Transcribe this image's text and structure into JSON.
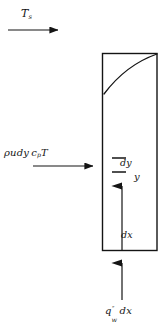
{
  "figure": {
    "type": "engineering-diagram",
    "width": 163,
    "height": 332,
    "background_color": "#ffffff",
    "line_color": "#141414"
  },
  "labels": {
    "freestream_temperature": {
      "base": "T",
      "subscript": "s",
      "full": "Ts",
      "x": 21,
      "y": 8
    },
    "enthalpy_influx": {
      "full": "ρudy c_p T",
      "rho": "ρ",
      "u": "u",
      "dy": "dy",
      "c": "c",
      "c_subscript": "p",
      "T": "T",
      "x": 4,
      "y": 148
    },
    "dy": {
      "full": "dy",
      "x": 120,
      "y": 158
    },
    "y_axis": {
      "full": "y",
      "x": 134,
      "y": 172
    },
    "dx": {
      "full": "dx",
      "x": 121,
      "y": 230
    },
    "wall_heat_flux": {
      "base": "q",
      "superscript": "″",
      "subscript": "w",
      "trailing": "dx",
      "full": "q″w dx",
      "x": 105,
      "y": 306
    }
  },
  "geometry": {
    "control_volume": {
      "name": "control-volume-rectangle",
      "left": 102.5,
      "top": 53.5,
      "right": 157,
      "bottom": 250.5
    },
    "boundary_layer_curve": {
      "name": "boundary-layer-profile",
      "start_x": 104,
      "start_y": 94,
      "end_x": 157,
      "end_y": 54
    },
    "freestream_arrow": {
      "name": "freestream-arrow",
      "x1": 8,
      "y1": 30,
      "x2": 66,
      "y2": 30
    },
    "influx_arrow": {
      "name": "enthalpy-influx-arrow",
      "x1": 33,
      "y1": 166,
      "x2": 101,
      "y2": 166
    },
    "y_arrow": {
      "name": "y-direction-arrow",
      "x1": 122,
      "y1": 250,
      "x2": 122,
      "y2": 175
    },
    "flux_arrow": {
      "name": "wall-heat-flux-arrow",
      "x1": 122,
      "y1": 300,
      "x2": 122,
      "y2": 252
    },
    "tick_marks": [
      {
        "name": "dy-upper-tick",
        "x1": 112,
        "y1": 158,
        "x2": 126,
        "y2": 158
      },
      {
        "name": "dy-lower-tick",
        "x1": 112,
        "y1": 172,
        "x2": 126,
        "y2": 172
      }
    ]
  }
}
